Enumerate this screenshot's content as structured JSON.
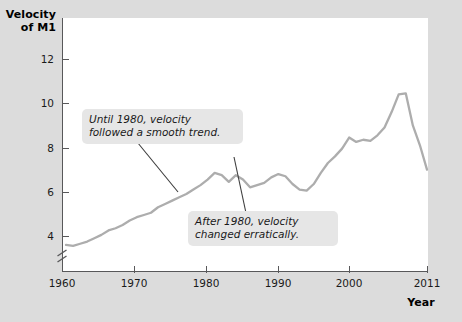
{
  "figure": {
    "background_color": "#dcdcdc",
    "panel_color": "#ffffff",
    "axis_color": "#58585a",
    "line_color": "#adadad",
    "callout_bg": "#e6e6e6"
  },
  "axis_titles": {
    "y_line1": "Velocity",
    "y_line2": "of M1",
    "x": "Year"
  },
  "y_ticks": [
    {
      "label": "4",
      "value": 4
    },
    {
      "label": "6",
      "value": 6
    },
    {
      "label": "8",
      "value": 8
    },
    {
      "label": "10",
      "value": 10
    },
    {
      "label": "12",
      "value": 12
    }
  ],
  "x_ticks": [
    {
      "label": "1960",
      "value": 1960
    },
    {
      "label": "1970",
      "value": 1970
    },
    {
      "label": "1980",
      "value": 1980
    },
    {
      "label": "1990",
      "value": 1990
    },
    {
      "label": "2000",
      "value": 2000
    },
    {
      "label": "2011",
      "value": 2011
    }
  ],
  "annotations": [
    {
      "id": "pre-1980",
      "text": "Until 1980, velocity\nfollowed a smooth trend."
    },
    {
      "id": "post-1980",
      "text": "After 1980, velocity\nchanged erratically."
    }
  ],
  "axis_break": {
    "present": true,
    "note": "y-axis break below 4"
  },
  "chart_data": {
    "type": "line",
    "title": "",
    "xlabel": "Year",
    "ylabel": "Velocity of M1",
    "xlim": [
      1960,
      2011
    ],
    "ylim": [
      3.0,
      12.6
    ],
    "grid": false,
    "legend": "none",
    "series": [
      {
        "name": "Velocity of M1",
        "x": [
          1960,
          1961,
          1962,
          1963,
          1964,
          1965,
          1966,
          1967,
          1968,
          1969,
          1970,
          1971,
          1972,
          1973,
          1974,
          1975,
          1976,
          1977,
          1978,
          1979,
          1980,
          1981,
          1982,
          1983,
          1984,
          1985,
          1986,
          1987,
          1988,
          1989,
          1990,
          1991,
          1992,
          1993,
          1994,
          1995,
          1996,
          1997,
          1998,
          1999,
          2000,
          2001,
          2002,
          2003,
          2004,
          2005,
          2006,
          2007,
          2008,
          2009,
          2010,
          2011
        ],
        "values": [
          3.6,
          3.55,
          3.65,
          3.75,
          3.9,
          4.05,
          4.25,
          4.35,
          4.5,
          4.7,
          4.85,
          4.95,
          5.05,
          5.3,
          5.45,
          5.6,
          5.75,
          5.9,
          6.1,
          6.3,
          6.55,
          6.85,
          6.75,
          6.45,
          6.75,
          6.55,
          6.2,
          6.3,
          6.4,
          6.65,
          6.8,
          6.7,
          6.35,
          6.1,
          6.05,
          6.35,
          6.85,
          7.3,
          7.6,
          7.95,
          8.45,
          8.25,
          8.35,
          8.3,
          8.55,
          8.9,
          9.6,
          10.4,
          10.45,
          9.0,
          8.1,
          7.0
        ]
      }
    ],
    "annotations": [
      {
        "text": "Until 1980, velocity followed a smooth trend.",
        "points_to_x": 1976,
        "points_to_y": 6.0
      },
      {
        "text": "After 1980, velocity changed erratically.",
        "points_to_x": 1983,
        "points_to_y": 6.6
      }
    ]
  }
}
